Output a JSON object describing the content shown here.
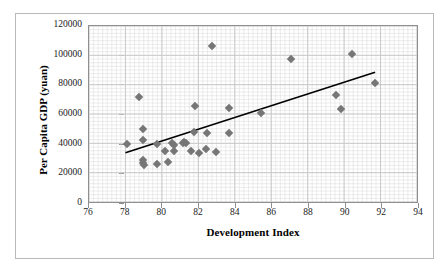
{
  "chart_data": {
    "type": "scatter",
    "title": "",
    "xlabel": "Development Index",
    "ylabel": "Per Capita GDP (yuan)",
    "xlim": [
      76,
      94
    ],
    "ylim": [
      0,
      120000
    ],
    "xticks": [
      76,
      78,
      80,
      82,
      84,
      86,
      88,
      90,
      92,
      94
    ],
    "yticks": [
      0,
      20000,
      40000,
      60000,
      80000,
      100000,
      120000
    ],
    "xtick_labels": [
      "76",
      "78",
      "80",
      "82",
      "84",
      "86",
      "88",
      "90",
      "92",
      "94"
    ],
    "ytick_labels": [
      "0",
      "20000",
      "40000",
      "60000",
      "80000",
      "100000",
      "120000"
    ],
    "grid": true,
    "minor_grid": true,
    "minor_grid_x_step": 0.25,
    "minor_grid_y_step": 2500,
    "legend": false,
    "marker_color": "#767676",
    "marker_shape": "diamond",
    "gridline_color": "#c9c9c9",
    "axis_color": "#8f8f8f",
    "trendline": {
      "type": "linear",
      "color": "#000000",
      "x": [
        78.0,
        91.7
      ],
      "y": [
        33500,
        88500
      ]
    },
    "points": [
      {
        "x": 78.05,
        "y": 40300
      },
      {
        "x": 78.75,
        "y": 71800
      },
      {
        "x": 78.95,
        "y": 50700
      },
      {
        "x": 78.95,
        "y": 43200
      },
      {
        "x": 78.92,
        "y": 29800
      },
      {
        "x": 78.95,
        "y": 27400
      },
      {
        "x": 78.98,
        "y": 26200
      },
      {
        "x": 79.7,
        "y": 40200
      },
      {
        "x": 79.72,
        "y": 26700
      },
      {
        "x": 80.15,
        "y": 35400
      },
      {
        "x": 80.3,
        "y": 28200
      },
      {
        "x": 80.55,
        "y": 41300
      },
      {
        "x": 80.62,
        "y": 39900
      },
      {
        "x": 80.65,
        "y": 35500
      },
      {
        "x": 81.15,
        "y": 41400
      },
      {
        "x": 81.2,
        "y": 41700
      },
      {
        "x": 81.28,
        "y": 41200
      },
      {
        "x": 81.55,
        "y": 35500
      },
      {
        "x": 81.75,
        "y": 48800
      },
      {
        "x": 81.8,
        "y": 65800
      },
      {
        "x": 82.02,
        "y": 34100
      },
      {
        "x": 82.4,
        "y": 37400
      },
      {
        "x": 82.45,
        "y": 48000
      },
      {
        "x": 82.7,
        "y": 106800
      },
      {
        "x": 82.92,
        "y": 35300
      },
      {
        "x": 83.62,
        "y": 64500
      },
      {
        "x": 83.65,
        "y": 47800
      },
      {
        "x": 85.38,
        "y": 61600
      },
      {
        "x": 87.0,
        "y": 97700
      },
      {
        "x": 89.48,
        "y": 73300
      },
      {
        "x": 89.72,
        "y": 63900
      },
      {
        "x": 90.35,
        "y": 101100
      },
      {
        "x": 91.6,
        "y": 81500
      }
    ]
  }
}
